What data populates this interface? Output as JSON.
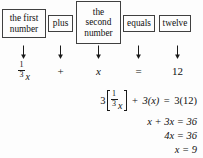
{
  "figure": {
    "type": "algebra-translation-diagram",
    "description_boxes": [
      {
        "id": "first-number",
        "label": "the first\nnumber"
      },
      {
        "id": "plus",
        "label": "plus"
      },
      {
        "id": "second-number",
        "label": "the\nsecond\nnumber"
      },
      {
        "id": "equals",
        "label": "equals"
      },
      {
        "id": "twelve",
        "label": "twelve"
      }
    ],
    "arrows": [
      {
        "id": "arrow-1",
        "glyph": "down-arrow"
      },
      {
        "id": "arrow-2",
        "glyph": "down-arrow"
      },
      {
        "id": "arrow-3",
        "glyph": "down-arrow"
      },
      {
        "id": "arrow-4",
        "glyph": "down-arrow"
      },
      {
        "id": "arrow-5",
        "glyph": "down-arrow"
      }
    ],
    "equation_terms": [
      {
        "id": "term-first-number",
        "kind": "fraction-times-var",
        "numerator": "1",
        "denominator": "3",
        "variable": "x"
      },
      {
        "id": "term-plus",
        "kind": "operator",
        "text": "+"
      },
      {
        "id": "term-second-number",
        "kind": "variable",
        "text": "x"
      },
      {
        "id": "term-equals",
        "kind": "operator",
        "text": "="
      },
      {
        "id": "term-twelve",
        "kind": "number",
        "text": "12"
      }
    ],
    "solution_steps": [
      {
        "id": "step-1",
        "parts": {
          "coefficient": "3",
          "bracket_open": "[",
          "frac_num": "1",
          "frac_den": "3",
          "frac_var": "x",
          "bracket_close": "]",
          "plus": "+",
          "second": "3(x)",
          "equals": "=",
          "right": "3(12)"
        }
      },
      {
        "id": "step-2",
        "text": "x + 3x = 36"
      },
      {
        "id": "step-3",
        "text": "4x = 36"
      },
      {
        "id": "step-4",
        "text": "x = 9"
      }
    ],
    "colors": {
      "background": "#fdfdfd",
      "ink": "#111111",
      "box_border": "#404040"
    }
  }
}
